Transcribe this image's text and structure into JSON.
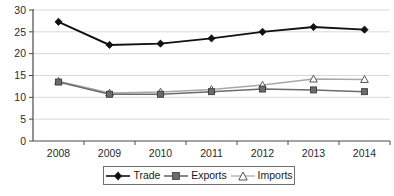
{
  "chart_data": {
    "type": "line",
    "title": "",
    "xlabel": "",
    "ylabel": "",
    "categories": [
      "2008",
      "2009",
      "2010",
      "2011",
      "2012",
      "2013",
      "2014"
    ],
    "ylim": [
      0,
      30
    ],
    "yticks": [
      0,
      5,
      10,
      15,
      20,
      25,
      30
    ],
    "grid": true,
    "legend_position": "bottom",
    "series": [
      {
        "name": "Trade",
        "marker": "diamond-filled",
        "color": "#111111",
        "values": [
          27.3,
          22.0,
          22.3,
          23.5,
          25.0,
          26.1,
          25.5
        ]
      },
      {
        "name": "Exports",
        "marker": "square-filled",
        "color": "#6b6b6b",
        "values": [
          13.5,
          10.7,
          10.7,
          11.3,
          11.9,
          11.7,
          11.3
        ]
      },
      {
        "name": "Imports",
        "marker": "triangle-open",
        "color": "#a8a8a8",
        "values": [
          13.7,
          11.0,
          11.2,
          11.8,
          12.8,
          14.2,
          14.1
        ]
      }
    ]
  },
  "axis": {
    "y_tick_labels": [
      "30",
      "25",
      "20",
      "15",
      "10",
      "5",
      "0"
    ],
    "x_tick_labels": [
      "2008",
      "2009",
      "2010",
      "2011",
      "2012",
      "2013",
      "2014"
    ]
  },
  "legend": {
    "entries": [
      {
        "label": "Trade"
      },
      {
        "label": "Exports"
      },
      {
        "label": "Imports"
      }
    ]
  },
  "caption": {
    "text": ""
  },
  "colors": {
    "grid": "#d9d9d9",
    "axis": "#4a4a4a",
    "trade": "#111111",
    "exports": "#6b6b6b",
    "imports": "#a8a8a8",
    "legend_border": "#6e6e6e",
    "background": "#ffffff"
  }
}
